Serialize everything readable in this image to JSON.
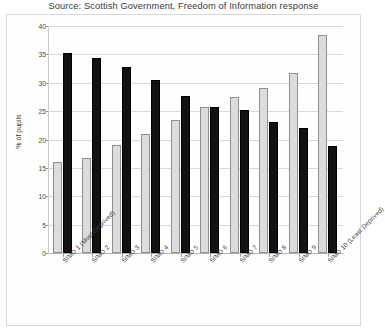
{
  "chart_data": {
    "type": "bar",
    "title": "Source: Scottish Government, Freedom of Information response",
    "xlabel": "",
    "ylabel": "% of pupils",
    "ylim": [
      0,
      40
    ],
    "yticks": [
      0,
      5,
      10,
      15,
      20,
      25,
      30,
      35,
      40
    ],
    "grid": true,
    "legend": "none",
    "categories": [
      "SIMD 1 (Most Deprived)",
      "SIMD 2",
      "SIMD 3",
      "SIMD 4",
      "SIMD 5",
      "SIMD 6",
      "SIMD 7",
      "SIMD 8",
      "SIMD 9",
      "SIMD 10 (Least Deprived)"
    ],
    "series": [
      {
        "name": "Light series",
        "color": "#dcdcdc",
        "values": [
          16.0,
          16.7,
          19.0,
          21.0,
          23.5,
          25.8,
          27.5,
          29.0,
          31.7,
          38.5
        ]
      },
      {
        "name": "Dark series",
        "color": "#121212",
        "values": [
          35.2,
          34.4,
          32.7,
          30.5,
          27.7,
          25.7,
          25.2,
          23.0,
          22.0,
          18.8
        ]
      }
    ]
  }
}
